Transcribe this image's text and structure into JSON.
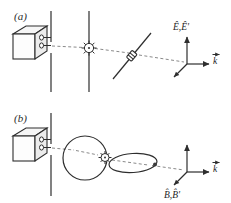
{
  "figure": {
    "background_color": "#ffffff",
    "ink_color": "#2e2e2e",
    "beam_color": "#8a8a8a",
    "panels": [
      {
        "id": "a",
        "label": "(a)",
        "caption_position": "top-left",
        "elements": [
          {
            "name": "light-source-box",
            "type": "3d-box",
            "description": "laser source cube with two port circles"
          },
          {
            "name": "port-circle-upper",
            "type": "circle"
          },
          {
            "name": "port-circle-lower",
            "type": "circle"
          },
          {
            "name": "slit-barrier",
            "type": "vertical-line-pair",
            "description": "aperture formed by gap between two vertical segments"
          },
          {
            "name": "screen-line",
            "type": "vertical-line"
          },
          {
            "name": "scattering-center",
            "type": "starburst",
            "description": "scattering particle emitting rays"
          },
          {
            "name": "analyzer-rod",
            "type": "tilted-rod",
            "description": "tilted polarizer rod with central element"
          },
          {
            "name": "beam-path",
            "type": "dashed-line"
          },
          {
            "name": "axis-triad",
            "type": "coordinate-triad",
            "axes": [
              "up",
              "right",
              "down-left"
            ]
          }
        ],
        "axis_labels": [
          {
            "name": "e-hat-label",
            "text": "Ê,Ê'",
            "position": "above-vertical-axis"
          },
          {
            "name": "k-hat-label",
            "text": "k⃗",
            "position": "right-of-horizontal-axis"
          }
        ]
      },
      {
        "id": "b",
        "label": "(b)",
        "caption_position": "mid-left",
        "elements": [
          {
            "name": "light-source-box",
            "type": "3d-box",
            "description": "laser source cube with two port circles"
          },
          {
            "name": "port-circle-upper",
            "type": "circle"
          },
          {
            "name": "port-circle-lower",
            "type": "circle"
          },
          {
            "name": "slit-barrier",
            "type": "vertical-line-pair",
            "description": "aperture formed by gap between two vertical segments"
          },
          {
            "name": "sphere-outline",
            "type": "circle",
            "description": "spherical radiation pattern"
          },
          {
            "name": "scattering-center",
            "type": "starburst",
            "description": "scattering particle on sphere edge"
          },
          {
            "name": "ellipse-outline",
            "type": "ellipse",
            "description": "flattened toroidal radiation lobe"
          },
          {
            "name": "ellipse-marker-dot",
            "type": "dot"
          },
          {
            "name": "beam-path",
            "type": "dashed-line"
          },
          {
            "name": "axis-triad",
            "type": "coordinate-triad",
            "axes": [
              "up",
              "right",
              "down-left"
            ]
          }
        ],
        "axis_labels": [
          {
            "name": "b-hat-label",
            "text": "B̂,B̂'",
            "position": "below-left-of-triad"
          },
          {
            "name": "k-hat-label",
            "text": "k⃗",
            "position": "right-of-horizontal-axis"
          }
        ]
      }
    ]
  },
  "labels": {
    "panel_a": "(a)",
    "panel_b": "(b)",
    "e_hat": "Ê,Ê'",
    "b_hat": "B̂,B̂'",
    "k_hat_a": "k",
    "k_hat_b": "k"
  }
}
